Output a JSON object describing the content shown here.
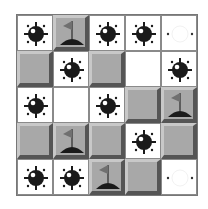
{
  "game": {
    "rows": 5,
    "cols": 5,
    "colors": {
      "raised": "#a8a8a8",
      "open": "#ffffff",
      "mine": "#1a1a1a"
    },
    "cells": [
      [
        "mine",
        "flag",
        "mine",
        "mine",
        "ghost-mine"
      ],
      [
        "covered",
        "mine",
        "covered",
        "empty",
        "mine"
      ],
      [
        "mine",
        "empty",
        "mine",
        "covered",
        "flag"
      ],
      [
        "covered",
        "flag",
        "covered",
        "mine",
        "covered"
      ],
      [
        "mine",
        "mine",
        "flag",
        "covered",
        "ghost-mine"
      ]
    ]
  }
}
